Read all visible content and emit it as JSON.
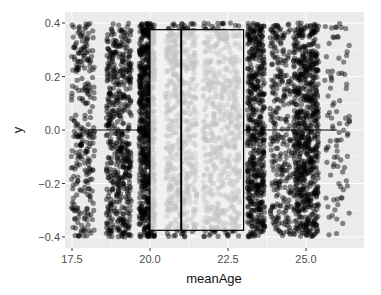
{
  "chart_data": {
    "type": "boxplot",
    "subtype": "horizontal boxplot with jittered points",
    "title": "",
    "xlabel": "meanAge",
    "ylabel": "y",
    "xlim": [
      17.2,
      26.9
    ],
    "ylim": [
      -0.43,
      0.43
    ],
    "x_ticks": [
      17.5,
      20.0,
      22.5,
      25.0
    ],
    "x_tick_labels": [
      "17.5",
      "20.0",
      "22.5",
      "25.0"
    ],
    "y_ticks": [
      0.4,
      0.2,
      0.0,
      -0.2,
      -0.4
    ],
    "y_tick_labels": [
      "0.4",
      "0.2",
      "0.0",
      "-0.2",
      "-0.4"
    ],
    "grid": true,
    "legend": "none",
    "box": {
      "lower_whisker": 18.0,
      "q1": 20.0,
      "median": 21.0,
      "q3": 23.0,
      "upper_whisker": 26.0,
      "y_extent": [
        -0.375,
        0.375
      ],
      "fill": "#f2f2f2",
      "fill_opacity": 0.8,
      "line_color": "#000000"
    },
    "jitter_bands": [
      {
        "center": 17.85,
        "width": 0.75,
        "density": "medium"
      },
      {
        "center": 19.0,
        "width": 0.8,
        "density": "high"
      },
      {
        "center": 19.9,
        "width": 0.5,
        "density": "very high"
      },
      {
        "center": 21.0,
        "width": 1.0,
        "density": "high"
      },
      {
        "center": 22.3,
        "width": 1.2,
        "density": "high"
      },
      {
        "center": 23.4,
        "width": 0.55,
        "density": "high"
      },
      {
        "center": 24.2,
        "width": 0.7,
        "density": "medium"
      },
      {
        "center": 25.0,
        "width": 0.8,
        "density": "very high"
      },
      {
        "center": 26.0,
        "width": 0.8,
        "density": "low"
      }
    ],
    "point_color": "#000000",
    "point_opacity": 0.45,
    "panel_background": "#ebebeb",
    "grid_color": "#ffffff"
  }
}
